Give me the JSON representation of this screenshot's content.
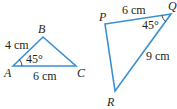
{
  "colors": {
    "edge": "#3a8fd1",
    "text": "#231f20"
  },
  "triangle_abc": {
    "vertices": {
      "A": "A",
      "B": "B",
      "C": "C"
    },
    "side_ab": "4 cm",
    "side_ac": "6 cm",
    "angle_a": "45°"
  },
  "triangle_pqr": {
    "vertices": {
      "P": "P",
      "Q": "Q",
      "R": "R"
    },
    "side_pq": "6 cm",
    "side_qr": "9 cm",
    "angle_q": "45°"
  }
}
